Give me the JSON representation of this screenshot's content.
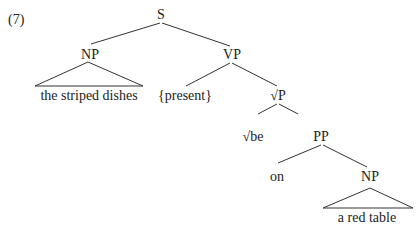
{
  "example_number": "(7)",
  "tree": {
    "root": "S",
    "nodes": {
      "s": "S",
      "np_subject": "NP",
      "subject_text": "the striped dishes",
      "vp": "VP",
      "tense": "{present}",
      "root_p": "√P",
      "root_be": "√be",
      "pp": "PP",
      "prep": "on",
      "np_object": "NP",
      "object_text": "a red table"
    }
  }
}
